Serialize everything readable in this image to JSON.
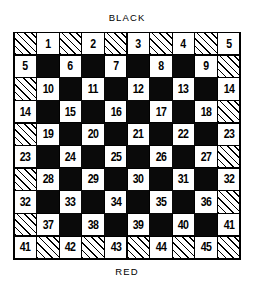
{
  "labels": {
    "top": "BLACK",
    "bottom": "RED"
  },
  "colors": {
    "ink": "#000000",
    "paper": "#ffffff",
    "dark_square": "#0a0a0a",
    "hatch_line": "#000000"
  },
  "board": {
    "rows": 10,
    "columns": 10,
    "cell_types": {
      "hatch": "hatched diagonal-line square",
      "black": "solid black square",
      "white": "white numbered square"
    },
    "grid": [
      [
        {
          "type": "hatch",
          "num": ""
        },
        {
          "type": "white",
          "num": "1"
        },
        {
          "type": "hatch",
          "num": ""
        },
        {
          "type": "white",
          "num": "2"
        },
        {
          "type": "hatch",
          "num": ""
        },
        {
          "type": "white",
          "num": "3"
        },
        {
          "type": "hatch",
          "num": ""
        },
        {
          "type": "white",
          "num": "4"
        },
        {
          "type": "hatch",
          "num": ""
        },
        {
          "type": "white",
          "num": "5"
        }
      ],
      [
        {
          "type": "white",
          "num": "5"
        },
        {
          "type": "black",
          "num": ""
        },
        {
          "type": "white",
          "num": "6"
        },
        {
          "type": "black",
          "num": ""
        },
        {
          "type": "white",
          "num": "7"
        },
        {
          "type": "black",
          "num": ""
        },
        {
          "type": "white",
          "num": "8"
        },
        {
          "type": "black",
          "num": ""
        },
        {
          "type": "white",
          "num": "9"
        },
        {
          "type": "hatch",
          "num": ""
        }
      ],
      [
        {
          "type": "hatch",
          "num": ""
        },
        {
          "type": "white",
          "num": "10"
        },
        {
          "type": "black",
          "num": ""
        },
        {
          "type": "white",
          "num": "11"
        },
        {
          "type": "black",
          "num": ""
        },
        {
          "type": "white",
          "num": "12"
        },
        {
          "type": "black",
          "num": ""
        },
        {
          "type": "white",
          "num": "13"
        },
        {
          "type": "black",
          "num": ""
        },
        {
          "type": "white",
          "num": "14"
        }
      ],
      [
        {
          "type": "white",
          "num": "14"
        },
        {
          "type": "black",
          "num": ""
        },
        {
          "type": "white",
          "num": "15"
        },
        {
          "type": "black",
          "num": ""
        },
        {
          "type": "white",
          "num": "16"
        },
        {
          "type": "black",
          "num": ""
        },
        {
          "type": "white",
          "num": "17"
        },
        {
          "type": "black",
          "num": ""
        },
        {
          "type": "white",
          "num": "18"
        },
        {
          "type": "hatch",
          "num": ""
        }
      ],
      [
        {
          "type": "hatch",
          "num": ""
        },
        {
          "type": "white",
          "num": "19"
        },
        {
          "type": "black",
          "num": ""
        },
        {
          "type": "white",
          "num": "20"
        },
        {
          "type": "black",
          "num": ""
        },
        {
          "type": "white",
          "num": "21"
        },
        {
          "type": "black",
          "num": ""
        },
        {
          "type": "white",
          "num": "22"
        },
        {
          "type": "black",
          "num": ""
        },
        {
          "type": "white",
          "num": "23"
        }
      ],
      [
        {
          "type": "white",
          "num": "23"
        },
        {
          "type": "black",
          "num": ""
        },
        {
          "type": "white",
          "num": "24"
        },
        {
          "type": "black",
          "num": ""
        },
        {
          "type": "white",
          "num": "25"
        },
        {
          "type": "black",
          "num": ""
        },
        {
          "type": "white",
          "num": "26"
        },
        {
          "type": "black",
          "num": ""
        },
        {
          "type": "white",
          "num": "27"
        },
        {
          "type": "hatch",
          "num": ""
        }
      ],
      [
        {
          "type": "hatch",
          "num": ""
        },
        {
          "type": "white",
          "num": "28"
        },
        {
          "type": "black",
          "num": ""
        },
        {
          "type": "white",
          "num": "29"
        },
        {
          "type": "black",
          "num": ""
        },
        {
          "type": "white",
          "num": "30"
        },
        {
          "type": "black",
          "num": ""
        },
        {
          "type": "white",
          "num": "31"
        },
        {
          "type": "black",
          "num": ""
        },
        {
          "type": "white",
          "num": "32"
        }
      ],
      [
        {
          "type": "white",
          "num": "32"
        },
        {
          "type": "black",
          "num": ""
        },
        {
          "type": "white",
          "num": "33"
        },
        {
          "type": "black",
          "num": ""
        },
        {
          "type": "white",
          "num": "34"
        },
        {
          "type": "black",
          "num": ""
        },
        {
          "type": "white",
          "num": "35"
        },
        {
          "type": "black",
          "num": ""
        },
        {
          "type": "white",
          "num": "36"
        },
        {
          "type": "hatch",
          "num": ""
        }
      ],
      [
        {
          "type": "hatch",
          "num": ""
        },
        {
          "type": "white",
          "num": "37"
        },
        {
          "type": "black",
          "num": ""
        },
        {
          "type": "white",
          "num": "38"
        },
        {
          "type": "black",
          "num": ""
        },
        {
          "type": "white",
          "num": "39"
        },
        {
          "type": "black",
          "num": ""
        },
        {
          "type": "white",
          "num": "40"
        },
        {
          "type": "black",
          "num": ""
        },
        {
          "type": "white",
          "num": "41"
        }
      ],
      [
        {
          "type": "white",
          "num": "41"
        },
        {
          "type": "hatch",
          "num": ""
        },
        {
          "type": "white",
          "num": "42"
        },
        {
          "type": "hatch",
          "num": ""
        },
        {
          "type": "white",
          "num": "43"
        },
        {
          "type": "hatch",
          "num": ""
        },
        {
          "type": "white",
          "num": "44"
        },
        {
          "type": "hatch",
          "num": ""
        },
        {
          "type": "white",
          "num": "45"
        },
        {
          "type": "hatch",
          "num": ""
        }
      ]
    ]
  }
}
